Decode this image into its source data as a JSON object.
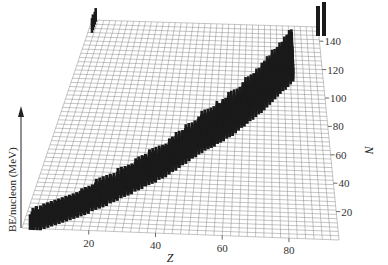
{
  "chart_data": {
    "type": "bar3d",
    "title": "",
    "xlabel": "Z",
    "ylabel": "N",
    "zlabel": "BE/nucleon (MeV)",
    "x_ticks": [
      20,
      40,
      60,
      80
    ],
    "y_ticks": [
      20,
      40,
      60,
      80,
      100,
      120,
      140
    ],
    "xlim": [
      0,
      95
    ],
    "ylim": [
      0,
      150
    ],
    "grid": true,
    "band": {
      "description": "Nuclides along the stability line, from light nuclei near (Z=1,N=0) to heavy nuclei near (Z=92,N=146)",
      "points": [
        {
          "Z": 2,
          "N": 2
        },
        {
          "Z": 10,
          "N": 10
        },
        {
          "Z": 20,
          "N": 22
        },
        {
          "Z": 30,
          "N": 36
        },
        {
          "Z": 40,
          "N": 50
        },
        {
          "Z": 50,
          "N": 68
        },
        {
          "Z": 60,
          "N": 82
        },
        {
          "Z": 70,
          "N": 100
        },
        {
          "Z": 80,
          "N": 120
        },
        {
          "Z": 83,
          "N": 126
        },
        {
          "Z": 90,
          "N": 142
        },
        {
          "Z": 92,
          "N": 146
        }
      ],
      "approx_height_MeV": 8
    },
    "isolated_bars": [
      {
        "Z": 90,
        "N": 142
      },
      {
        "Z": 92,
        "N": 146
      }
    ]
  },
  "labels": {
    "z_axis_title": "Z",
    "n_axis_title": "N",
    "vertical_axis_title": "BE/nucleon (MeV)"
  },
  "colors": {
    "grid": "#8a8a8a",
    "bars": "#1a1a1a",
    "background": "#ffffff",
    "text": "#333333"
  }
}
